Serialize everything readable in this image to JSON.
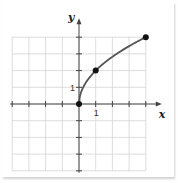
{
  "chart_data": {
    "type": "line",
    "title": "",
    "xlabel": "x",
    "ylabel": "y",
    "xlim": [
      -4,
      4
    ],
    "ylim": [
      -4,
      4
    ],
    "grid": true,
    "x_tick_labels": [
      {
        "value": 1,
        "label": "1"
      }
    ],
    "y_tick_labels": [
      {
        "value": 1,
        "label": "1"
      }
    ],
    "series": [
      {
        "name": "y = 2√x",
        "function": "2*sqrt(x)",
        "domain": [
          0,
          4
        ],
        "color": "#555555",
        "points": [
          {
            "x": 0,
            "y": 0
          },
          {
            "x": 1,
            "y": 2
          },
          {
            "x": 4,
            "y": 4
          }
        ]
      }
    ]
  },
  "colors": {
    "grid": "#d4d4d4",
    "axis": "#444444",
    "curve": "#555555",
    "point": "#111111"
  }
}
